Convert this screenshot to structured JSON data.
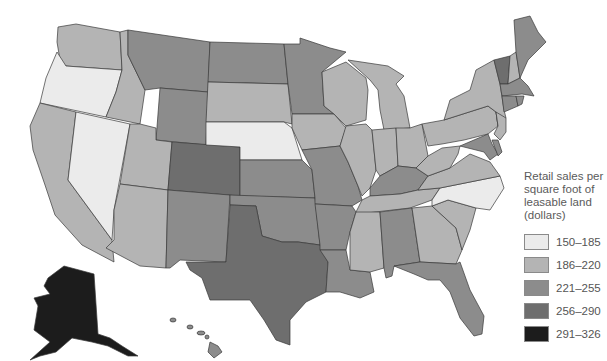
{
  "map": {
    "title": "Retail sales per square foot of leasable land (dollars)",
    "type": "choropleth",
    "region": "United States",
    "bins": [
      {
        "id": "b1",
        "range": "150–185",
        "color": "#ebebeb"
      },
      {
        "id": "b2",
        "range": "186–220",
        "color": "#b4b4b4"
      },
      {
        "id": "b3",
        "range": "221–255",
        "color": "#8c8c8c"
      },
      {
        "id": "b4",
        "range": "256–290",
        "color": "#6e6e6e"
      },
      {
        "id": "b5",
        "range": "291–326",
        "color": "#1c1c1c"
      }
    ],
    "states": {
      "WA": "b2",
      "OR": "b1",
      "CA": "b2",
      "NV": "b1",
      "ID": "b2",
      "MT": "b3",
      "WY": "b3",
      "UT": "b2",
      "AZ": "b2",
      "CO": "b4",
      "NM": "b3",
      "ND": "b3",
      "SD": "b2",
      "NE": "b1",
      "KS": "b3",
      "OK": "b3",
      "TX": "b4",
      "MN": "b3",
      "IA": "b2",
      "MO": "b3",
      "AR": "b3",
      "LA": "b3",
      "WI": "b2",
      "IL": "b2",
      "MI": "b2",
      "IN": "b2",
      "OH": "b2",
      "KY": "b3",
      "TN": "b2",
      "MS": "b2",
      "AL": "b3",
      "GA": "b2",
      "FL": "b3",
      "SC": "b2",
      "NC": "b1",
      "VA": "b2",
      "WV": "b2",
      "PA": "b2",
      "NY": "b2",
      "NJ": "b2",
      "DE": "b3",
      "MD": "b3",
      "CT": "b3",
      "RI": "b3",
      "MA": "b3",
      "VT": "b4",
      "NH": "b2",
      "ME": "b3",
      "AK": "b5",
      "HI": "b3"
    }
  },
  "legend": {
    "title_lines": [
      "Retail sales per",
      "square foot of",
      "leasable land",
      "(dollars)"
    ],
    "items": [
      {
        "label": "150–185",
        "color": "#ebebeb"
      },
      {
        "label": "186–220",
        "color": "#b4b4b4"
      },
      {
        "label": "221–255",
        "color": "#8c8c8c"
      },
      {
        "label": "256–290",
        "color": "#6e6e6e"
      },
      {
        "label": "291–326",
        "color": "#1c1c1c"
      }
    ]
  }
}
